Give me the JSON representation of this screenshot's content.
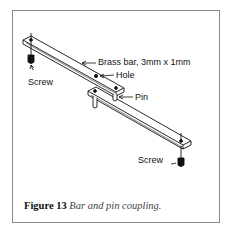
{
  "figure": {
    "number_label": "Figure 13",
    "title": "Bar and pin coupling.",
    "labels": {
      "brass_bar": "Brass bar, 3mm x 1mm",
      "hole": "Hole",
      "pin": "Pin",
      "screw_left": "Screw",
      "screw_right": "Screw"
    }
  },
  "colors": {
    "line": "#111111",
    "frame_border": "#8a8a8a",
    "caption_italic": "#444444"
  }
}
